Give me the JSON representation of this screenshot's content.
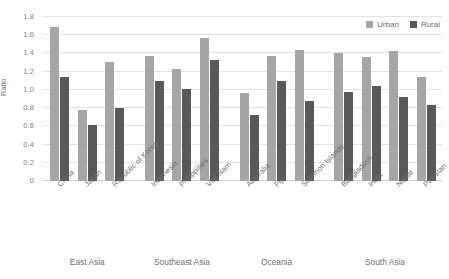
{
  "chart_data": {
    "type": "bar",
    "title": "",
    "xlabel": "",
    "ylabel": "Ratio",
    "ylim": [
      0,
      1.8
    ],
    "ytick_values": [
      1.8,
      1.6,
      1.4,
      1.2,
      1.0,
      0.8,
      0.6,
      0.4,
      0.2,
      0
    ],
    "ytick_labels": [
      "1.8",
      "1.6",
      "1.4",
      "1.2",
      "1.0",
      "0.8",
      "0.6",
      "0.4",
      "0.2",
      "0"
    ],
    "grid": true,
    "legend_position": "top-right",
    "categories": [
      "China",
      "Japan",
      "Republic of Korea",
      "Indonesia",
      "Philippines",
      "Viet Nam",
      "Australia",
      "Fiji",
      "Solomon Islands",
      "Bangladesh",
      "India",
      "Nepal",
      "Pakistan"
    ],
    "series": [
      {
        "name": "Urban",
        "color": "#a6a6a6",
        "values": [
          1.69,
          0.78,
          1.31,
          1.37,
          1.23,
          1.57,
          0.97,
          1.37,
          1.44,
          1.4,
          1.36,
          1.43,
          1.14
        ]
      },
      {
        "name": "Rural",
        "color": "#595959",
        "values": [
          1.14,
          0.61,
          0.8,
          1.1,
          1.01,
          1.33,
          0.73,
          1.1,
          0.88,
          0.98,
          1.04,
          0.92,
          0.83
        ]
      }
    ],
    "groups": [
      {
        "label": "East Asia",
        "categories": [
          "China",
          "Japan",
          "Republic of Korea"
        ]
      },
      {
        "label": "Southeast Asia",
        "categories": [
          "Indonesia",
          "Philippines",
          "Viet Nam"
        ]
      },
      {
        "label": "Oceania",
        "categories": [
          "Australia",
          "Fiji",
          "Solomon Islands"
        ]
      },
      {
        "label": "South Asia",
        "categories": [
          "Bangladesh",
          "India",
          "Nepal",
          "Pakistan"
        ]
      }
    ]
  },
  "legend": {
    "items": [
      {
        "label": "Urban",
        "color": "#a6a6a6"
      },
      {
        "label": "Rural",
        "color": "#595959"
      }
    ]
  },
  "colors": {
    "urban": "#a6a6a6",
    "rural": "#595959",
    "gridline": "#e2e2e2",
    "text": "#6f6f6f",
    "background": "#ffffff"
  }
}
